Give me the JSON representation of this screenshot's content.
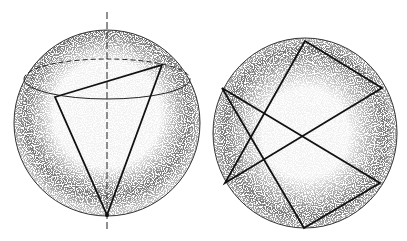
{
  "figure": {
    "colors": {
      "line": "#1a1a1a",
      "stipple": "#555555",
      "background": "#ffffff"
    },
    "left_sphere": {
      "center": [
        107,
        123
      ],
      "radius": 93,
      "axis": {
        "x": 107,
        "y1": 12,
        "y2": 231,
        "style": "dashed"
      },
      "equator_ellipse": {
        "cx": 107,
        "cy": 79,
        "rx": 83,
        "ry": 20,
        "back_half": "dashed"
      },
      "triangle": [
        [
          55,
          97
        ],
        [
          162,
          65
        ],
        [
          107,
          215
        ]
      ]
    },
    "right_sphere": {
      "center": [
        305,
        133
      ],
      "rx": 92,
      "ry": 95,
      "hexagram": {
        "up_triangle": [
          [
            305,
            41
          ],
          [
            382,
            88
          ],
          [
            225,
            183
          ]
        ],
        "down_triangle": [
          [
            222,
            88
          ],
          [
            380,
            183
          ],
          [
            304,
            228
          ]
        ]
      }
    }
  }
}
